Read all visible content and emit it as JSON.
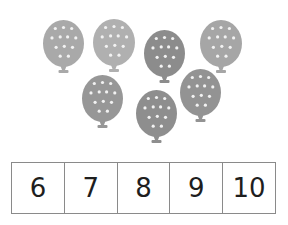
{
  "scene": {
    "description": "Count the balloons and choose the matching number",
    "balloon_count": 7
  },
  "balloons": [
    {
      "x": 43,
      "y": 20,
      "w": 41,
      "h": 47,
      "color": "#a9a9a9"
    },
    {
      "x": 93,
      "y": 19,
      "w": 42,
      "h": 47,
      "color": "#b0b0b0"
    },
    {
      "x": 144,
      "y": 30,
      "w": 41,
      "h": 47,
      "color": "#8c8c8c"
    },
    {
      "x": 200,
      "y": 20,
      "w": 42,
      "h": 47,
      "color": "#a6a6a6"
    },
    {
      "x": 82,
      "y": 75,
      "w": 41,
      "h": 47,
      "color": "#979797"
    },
    {
      "x": 136,
      "y": 90,
      "w": 41,
      "h": 47,
      "color": "#8e8e8e"
    },
    {
      "x": 180,
      "y": 69,
      "w": 41,
      "h": 47,
      "color": "#939393"
    }
  ],
  "number_choices": {
    "options": [
      "6",
      "7",
      "8",
      "9",
      "10"
    ]
  }
}
